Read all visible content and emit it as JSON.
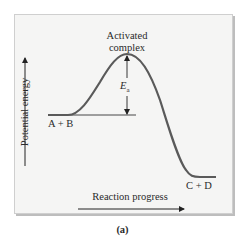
{
  "diagram": {
    "y_axis_label": "Potential energy",
    "x_axis_label": "Reaction progress",
    "peak_label_line1": "Activated",
    "peak_label_line2": "complex",
    "activation_energy_symbol": "E",
    "activation_energy_subscript": "a",
    "reactants_label": "A + B",
    "products_label": "C + D",
    "caption": "(a)"
  },
  "colors": {
    "curve": "#5a5a5a",
    "panel_bg": "#f5f5f4",
    "text": "#2a2a2a"
  }
}
